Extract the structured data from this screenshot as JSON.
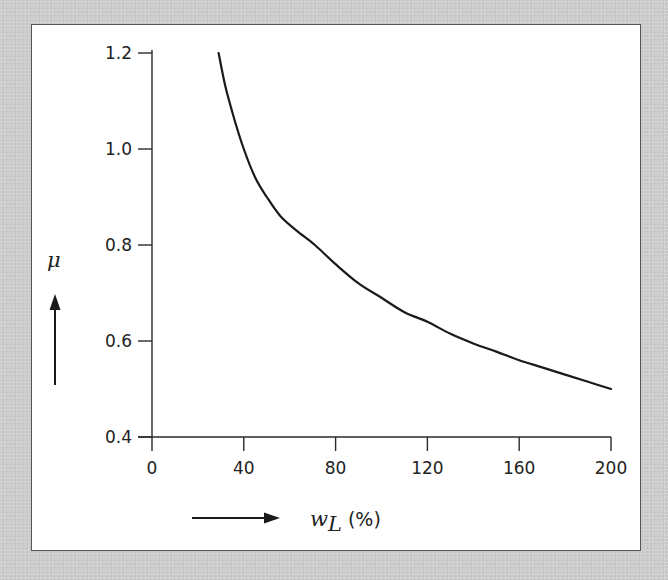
{
  "chart_data": {
    "type": "line",
    "title": "",
    "xlabel": "w_L (%)",
    "xlabel_main": "w",
    "xlabel_sub": "L",
    "xlabel_unit": "(%)",
    "ylabel": "μ",
    "xlim": [
      0,
      200
    ],
    "ylim": [
      0.4,
      1.2
    ],
    "x_ticks": [
      0,
      40,
      80,
      120,
      160,
      200
    ],
    "x_tick_labels": [
      "0",
      "40",
      "80",
      "120",
      "160",
      "200"
    ],
    "y_ticks": [
      0.4,
      0.6,
      0.8,
      1.0,
      1.2
    ],
    "y_tick_labels": [
      "0.4",
      "0.6",
      "0.8",
      "1.0",
      "1.2"
    ],
    "grid": false,
    "legend": null,
    "series": [
      {
        "name": "μ vs w_L",
        "x": [
          29,
          32,
          36,
          40,
          45,
          50,
          56,
          63,
          71,
          80,
          90,
          100,
          110,
          120,
          130,
          140,
          150,
          160,
          170,
          180,
          190,
          200
        ],
        "y": [
          1.2,
          1.13,
          1.06,
          1.0,
          0.94,
          0.9,
          0.86,
          0.83,
          0.8,
          0.76,
          0.72,
          0.69,
          0.66,
          0.64,
          0.615,
          0.595,
          0.578,
          0.56,
          0.545,
          0.53,
          0.515,
          0.5
        ]
      }
    ]
  },
  "colors": {
    "background": "#cdcdcd",
    "frame_border": "#555555",
    "plot_background": "#ffffff",
    "line": "#1a1a1a"
  }
}
